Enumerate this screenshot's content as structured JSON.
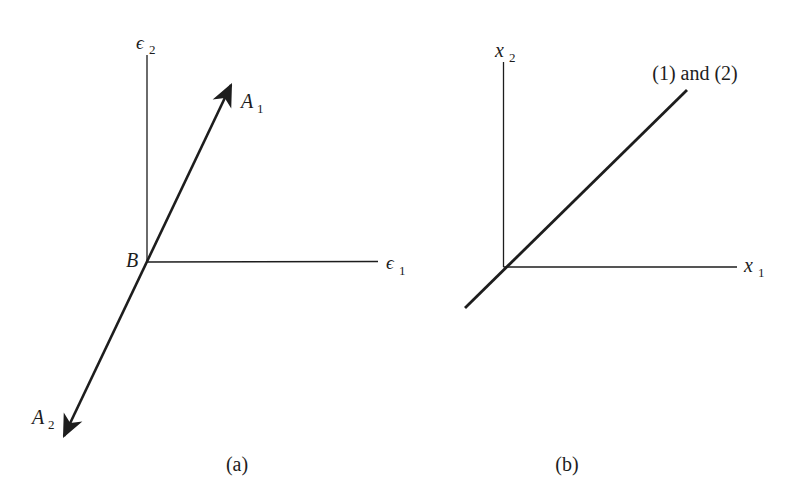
{
  "figure": {
    "colors": {
      "ink": "#1d1d1d",
      "background": "#ffffff"
    },
    "panel_a": {
      "caption": "(a)",
      "axis_y_label": {
        "base": "ϵ",
        "sub": "2"
      },
      "axis_x_label": {
        "base": "ϵ",
        "sub": "1"
      },
      "origin_label": "B",
      "vector_up_label": {
        "base": "A",
        "sub": "1"
      },
      "vector_down_label": {
        "base": "A",
        "sub": "2"
      }
    },
    "panel_b": {
      "caption": "(b)",
      "axis_y_label": {
        "base": "x",
        "sub": "2"
      },
      "axis_x_label": {
        "base": "x",
        "sub": "1"
      },
      "line_label": "(1) and (2)"
    }
  }
}
